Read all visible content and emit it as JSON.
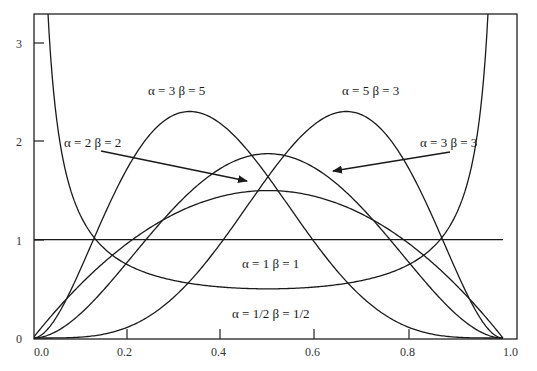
{
  "chart_data": {
    "type": "line",
    "title": "",
    "xlabel": "",
    "ylabel": "",
    "xlim": [
      0.0,
      1.0
    ],
    "ylim": [
      0,
      3.3
    ],
    "grid": false,
    "legend": "inline annotations",
    "x_ticks": [
      "0.0",
      "0.2",
      "0.4",
      "0.6",
      "0.8",
      "1.0"
    ],
    "y_ticks": [
      "0",
      "1",
      "2",
      "3"
    ],
    "series": [
      {
        "name": "α = 1/2  β = 1/2",
        "alpha": 0.5,
        "beta": 0.5,
        "shape": "U-shaped",
        "min_value": 0.5
      },
      {
        "name": "α = 1  β = 1",
        "alpha": 1,
        "beta": 1,
        "shape": "flat",
        "value": 1.0
      },
      {
        "name": "α = 2  β = 2",
        "alpha": 2,
        "beta": 2,
        "peak_x": 0.5,
        "peak_y": 1.5
      },
      {
        "name": "α = 3  β = 3",
        "alpha": 3,
        "beta": 3,
        "peak_x": 0.5,
        "peak_y": 1.875
      },
      {
        "name": "α = 3  β = 5",
        "alpha": 3,
        "beta": 5,
        "peak_x": 0.333,
        "peak_y": 2.36
      },
      {
        "name": "α = 5 β = 3",
        "alpha": 5,
        "beta": 3,
        "peak_x": 0.667,
        "peak_y": 2.36
      }
    ],
    "annotations": [
      {
        "text": "α = 3  β = 5",
        "x": 0.33,
        "y": 2.45
      },
      {
        "text": "α = 5 β = 3",
        "x": 0.67,
        "y": 2.45
      },
      {
        "text": "α = 2  β = 2",
        "x": 0.08,
        "y": 1.9,
        "arrow_to": [
          0.46,
          1.6
        ]
      },
      {
        "text": "α = 3  β = 3",
        "x": 0.92,
        "y": 1.9,
        "arrow_to": [
          0.64,
          1.7
        ]
      },
      {
        "text": "α = 1  β = 1",
        "x": 0.5,
        "y": 0.85
      },
      {
        "text": "α = 1/2  β = 1/2",
        "x": 0.5,
        "y": 0.35
      }
    ]
  },
  "labels": {
    "a3b5": "α = 3  β = 5",
    "a5b3": "α = 5 β = 3",
    "a2b2": "α = 2  β = 2",
    "a3b3": "α = 3  β = 3",
    "a1b1": "α = 1  β = 1",
    "ahbh": "α = 1/2  β = 1/2"
  },
  "axes": {
    "x_ticks": [
      "0.0",
      "0.2",
      "0.4",
      "0.6",
      "0.8",
      "1.0"
    ],
    "y_ticks": [
      "0",
      "1",
      "2",
      "3"
    ]
  }
}
